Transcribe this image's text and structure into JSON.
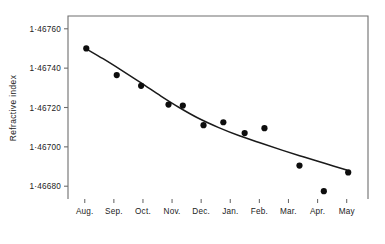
{
  "chart_data": {
    "type": "scatter",
    "title": "",
    "xlabel": "",
    "ylabel": "Refractive index",
    "categories": [
      "Aug.",
      "Sep.",
      "Oct.",
      "Nov.",
      "Dec.",
      "Jan.",
      "Feb.",
      "Mar.",
      "Apr.",
      "May"
    ],
    "ytick_labels": [
      "1·46760",
      "1·46740",
      "1·46720",
      "1·46700",
      "1·46680"
    ],
    "ytick_values": [
      1.4676,
      1.4674,
      1.4672,
      1.467,
      1.4668
    ],
    "ylim": [
      1.466735,
      1.467665
    ],
    "xlim": [
      0.45,
      10.3
    ],
    "grid": false,
    "legend": false,
    "marker": "filled-circle",
    "marker_color": "#0d0d0d",
    "curve_color": "#1a1a1a",
    "points": [
      {
        "month": "Aug.",
        "x": 1.05,
        "y": 1.4675
      },
      {
        "month": "Sep.",
        "x": 2.05,
        "y": 1.467365
      },
      {
        "month": "Oct.",
        "x": 2.85,
        "y": 1.46731
      },
      {
        "month": "Nov.",
        "x": 3.75,
        "y": 1.467215
      },
      {
        "month": "Nov.",
        "x": 4.22,
        "y": 1.46721
      },
      {
        "month": "Dec.",
        "x": 4.9,
        "y": 1.46711
      },
      {
        "month": "Dec.",
        "x": 5.55,
        "y": 1.467125
      },
      {
        "month": "Jan.",
        "x": 6.25,
        "y": 1.46707
      },
      {
        "month": "Jan.",
        "x": 6.9,
        "y": 1.467095
      },
      {
        "month": "Mar.",
        "x": 8.05,
        "y": 1.466905
      },
      {
        "month": "Apr.",
        "x": 8.85,
        "y": 1.466775
      },
      {
        "month": "May",
        "x": 9.65,
        "y": 1.46687
      }
    ],
    "fit_curve": [
      {
        "x": 1.05,
        "y": 1.467498
      },
      {
        "x": 1.6,
        "y": 1.467448
      },
      {
        "x": 2.2,
        "y": 1.46739
      },
      {
        "x": 2.85,
        "y": 1.467325
      },
      {
        "x": 3.5,
        "y": 1.467258
      },
      {
        "x": 4.1,
        "y": 1.4672
      },
      {
        "x": 4.7,
        "y": 1.467148
      },
      {
        "x": 5.4,
        "y": 1.467098
      },
      {
        "x": 6.1,
        "y": 1.467055
      },
      {
        "x": 6.8,
        "y": 1.467018
      },
      {
        "x": 7.5,
        "y": 1.466982
      },
      {
        "x": 8.2,
        "y": 1.466948
      },
      {
        "x": 8.9,
        "y": 1.466915
      },
      {
        "x": 9.6,
        "y": 1.466882
      }
    ]
  }
}
